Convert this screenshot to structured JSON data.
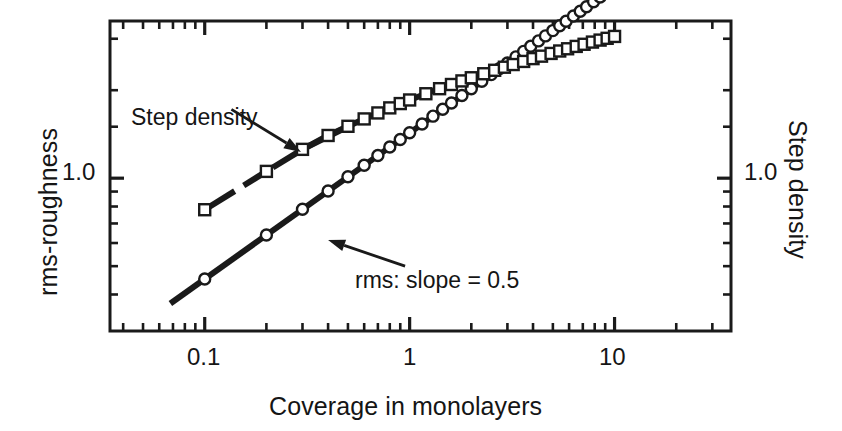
{
  "figure": {
    "background_color": "#ffffff",
    "ink_color": "#1a1a1a"
  },
  "chart_data": {
    "type": "scatter",
    "title": "",
    "subtitle": "",
    "xlabel": "Coverage in monolayers",
    "ylabel": "rms-roughness",
    "y2label": "Step density",
    "xscale": "log",
    "yscale": "log",
    "grid": false,
    "legend_position": "none",
    "xlim": [
      0.0345,
      37.0
    ],
    "ylim": [
      0.3,
      3.45
    ],
    "y2lim": [
      0.3,
      3.45
    ],
    "xticks_major": [
      0.1,
      1,
      10
    ],
    "xticklabels": [
      "0.1",
      "1",
      "10"
    ],
    "yticks_major": [
      1.0
    ],
    "yticklabels": [
      "1.0"
    ],
    "y2ticks_major": [
      1.0
    ],
    "y2ticklabels": [
      "1.0"
    ],
    "xticks_minor": [
      0.04,
      0.05,
      0.06,
      0.07,
      0.08,
      0.09,
      0.2,
      0.3,
      0.4,
      0.5,
      0.6,
      0.7,
      0.8,
      0.9,
      2,
      3,
      4,
      5,
      6,
      7,
      8,
      9,
      20,
      30
    ],
    "yticks_minor": [
      0.4,
      0.5,
      0.6,
      0.7,
      0.8,
      0.9,
      1.5,
      2,
      3
    ],
    "annotations": [
      {
        "name": "step-density-annotation",
        "text": "Step density",
        "text_x": 0.11,
        "text_y": 1.95,
        "arrow_from": [
          0.135,
          1.72
        ],
        "arrow_to": [
          0.295,
          1.23
        ]
      },
      {
        "name": "rms-slope-annotation",
        "text": "rms: slope = 0.5",
        "text_x": 0.52,
        "text_y": 0.455,
        "arrow_from": [
          0.95,
          0.5
        ],
        "arrow_to": [
          0.4,
          0.615
        ]
      }
    ],
    "series": [
      {
        "name": "rms-roughness",
        "label": "rms: slope = 0.5",
        "marker": "open-circle",
        "marker_size": 11,
        "line": "solid-thick",
        "line_width": 6,
        "color": "#1a1a1a",
        "slope": 0.5,
        "fit_line": {
          "x": [
            0.068,
            16.0
          ],
          "y": [
            0.3725,
            5.71
          ]
        },
        "x": [
          0.1,
          0.2,
          0.3,
          0.4,
          0.5,
          0.6,
          0.7,
          0.8,
          0.9,
          1.0,
          1.15,
          1.3,
          1.45,
          1.6,
          1.8,
          2.0,
          2.25,
          2.5,
          2.75,
          3.0,
          3.3,
          3.6,
          3.9,
          4.25,
          4.6,
          5.0,
          5.4,
          5.8,
          6.3,
          6.8,
          7.3,
          7.9,
          8.5,
          9.2,
          10.0
        ],
        "y": [
          0.452,
          0.639,
          0.783,
          0.904,
          1.011,
          1.107,
          1.196,
          1.279,
          1.356,
          1.43,
          1.533,
          1.63,
          1.722,
          1.809,
          1.918,
          2.022,
          2.145,
          2.261,
          2.372,
          2.477,
          2.6,
          2.716,
          2.826,
          2.949,
          3.068,
          3.199,
          3.324,
          3.444,
          3.588,
          3.727,
          3.861,
          4.016,
          4.166,
          4.334,
          4.518
        ],
        "y_model": "y = 1.43 * x^0.5"
      },
      {
        "name": "step-density",
        "label": "Step density",
        "marker": "open-square",
        "marker_size": 11,
        "line": "dashed-thick",
        "line_width": 6,
        "color": "#1a1a1a",
        "x": [
          0.1,
          0.2,
          0.3,
          0.4,
          0.5,
          0.6,
          0.7,
          0.8,
          0.9,
          1.0,
          1.2,
          1.4,
          1.6,
          1.8,
          2.0,
          2.3,
          2.6,
          2.9,
          3.2,
          3.6,
          4.0,
          4.4,
          4.9,
          5.4,
          5.9,
          6.5,
          7.1,
          7.8,
          8.5,
          9.2,
          10.0
        ],
        "y": [
          0.78,
          1.055,
          1.255,
          1.4,
          1.505,
          1.595,
          1.672,
          1.74,
          1.8,
          1.852,
          1.945,
          2.024,
          2.092,
          2.152,
          2.206,
          2.277,
          2.34,
          2.397,
          2.448,
          2.509,
          2.565,
          2.615,
          2.672,
          2.724,
          2.772,
          2.824,
          2.872,
          2.922,
          2.968,
          3.01,
          3.055
        ],
        "dashed_segments": [
          {
            "x": [
              0.105,
              0.14
            ]
          },
          {
            "x": [
              0.155,
              0.2
            ]
          },
          {
            "x": [
              0.215,
              0.3
            ]
          },
          {
            "x": [
              0.305,
              0.52
            ]
          }
        ]
      }
    ]
  },
  "axes": {
    "frame": {
      "left": 110,
      "top": 21,
      "right": 731,
      "bottom": 331,
      "line_width": 3
    },
    "x_axis_name": "x-axis-log-coverage",
    "y_axis_name": "y-axis-log-rms-roughness",
    "y2_axis_name": "y2-axis-log-step-density"
  }
}
